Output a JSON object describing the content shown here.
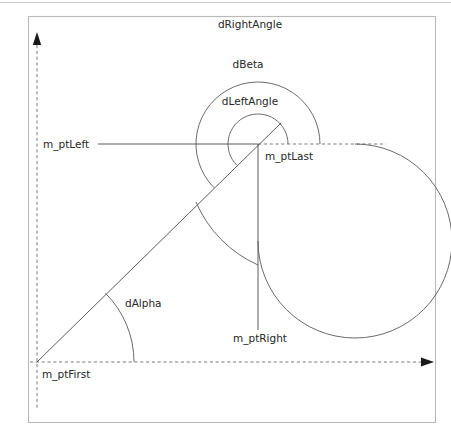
{
  "figure": {
    "background_color": "#ffffff",
    "frame_color": "#b9b9b9",
    "line_color": "#4a4a4a",
    "arc_color": "#5a5a5a",
    "dash_color": "#6d6d6d",
    "text_color": "#262626"
  },
  "labels": {
    "d_right_angle": "dRightAngle",
    "d_beta": "dBeta",
    "d_left_angle": "dLeftAngle",
    "d_alpha": "dAlpha",
    "m_pt_left": "m_ptLeft",
    "m_pt_last": "m_ptLast",
    "m_pt_right": "m_ptRight",
    "m_pt_first": "m_ptFirst"
  },
  "geometry": {
    "origin": {
      "name": "m_ptFirst",
      "x": 37,
      "y": 362
    },
    "center": {
      "name": "m_ptLast",
      "x": 258,
      "y": 144
    },
    "right_point": {
      "name": "m_ptRight",
      "x": 258,
      "y": 330
    },
    "left_ray_start_x": 98,
    "arc_radii": {
      "d_left_angle": 30,
      "d_beta": 62,
      "d_right_angle": 97
    },
    "alpha_arc_radius": 97,
    "alpha_degrees": 45,
    "axis": {
      "y_top": 45,
      "y_bottom": 410,
      "x_right": 427,
      "x_left": 37
    }
  }
}
